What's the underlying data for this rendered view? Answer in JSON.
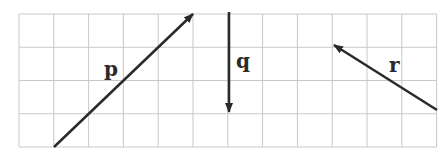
{
  "grid": {
    "left": 19,
    "top": 14,
    "cols": 12,
    "rows": 4,
    "cell_w": 34.8,
    "cell_h": 33.25,
    "line_color": "#c8c8c8"
  },
  "vectors": [
    {
      "label": "p",
      "x1": 54,
      "y1": 147,
      "x2": 193,
      "y2": 14,
      "label_x": 104,
      "label_y": 76
    },
    {
      "label": "q",
      "x1": 229,
      "y1": 12,
      "x2": 229,
      "y2": 112,
      "label_x": 236,
      "label_y": 68
    },
    {
      "label": "r",
      "x1": 437,
      "y1": 110,
      "x2": 334,
      "y2": 45,
      "label_x": 389,
      "label_y": 72
    }
  ],
  "arrow_color": "#2a2a2a"
}
